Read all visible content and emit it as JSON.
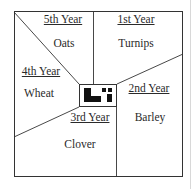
{
  "diagram": {
    "type": "crop-rotation-field-plan",
    "fields": [
      {
        "year": "1st Year",
        "crop": "Turnips"
      },
      {
        "year": "2nd Year",
        "crop": "Barley"
      },
      {
        "year": "3rd Year",
        "crop": "Clover"
      },
      {
        "year": "4th Year",
        "crop": "Wheat"
      },
      {
        "year": "5th Year",
        "crop": "Oats"
      }
    ],
    "center": "farmstead-buildings",
    "colors": {
      "line": "#333333",
      "text": "#2a2a2a",
      "background": "#ffffff"
    }
  }
}
